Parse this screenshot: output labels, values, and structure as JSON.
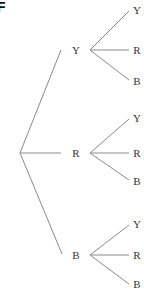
{
  "figure": {
    "corner_label": "F",
    "root": "",
    "level1": [
      {
        "label": "Y",
        "children": [
          "Y",
          "R",
          "B"
        ]
      },
      {
        "label": "R",
        "children": [
          "Y",
          "R",
          "B"
        ]
      },
      {
        "label": "B",
        "children": [
          "Y",
          "R",
          "B"
        ]
      }
    ],
    "colors": {
      "edge": "#8a8a8a",
      "text": "#333333"
    }
  }
}
